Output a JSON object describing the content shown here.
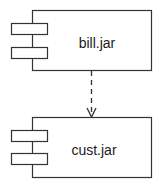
{
  "diagram": {
    "type": "uml-component-dependency",
    "stroke_color": "#333333",
    "components": [
      {
        "id": "bill",
        "label": "bill.jar"
      },
      {
        "id": "cust",
        "label": "cust.jar"
      }
    ],
    "dependencies": [
      {
        "from": "bill",
        "to": "cust",
        "style": "dashed",
        "arrowhead": "open"
      }
    ]
  }
}
